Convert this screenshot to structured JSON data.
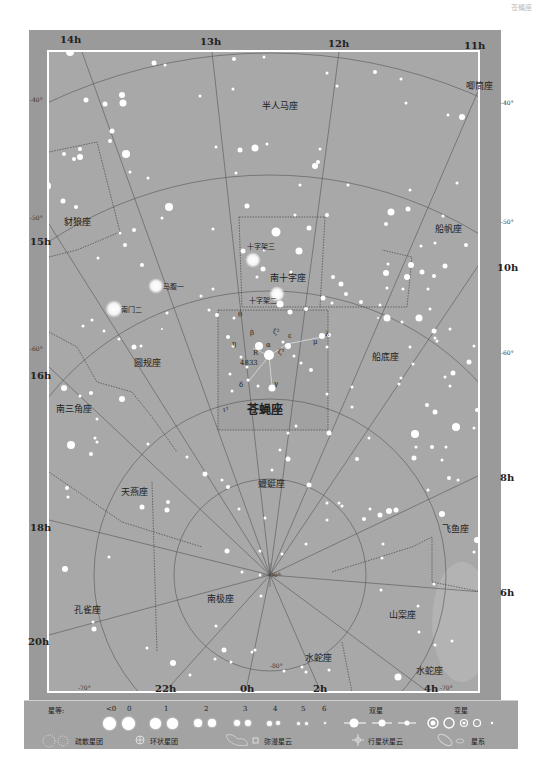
{
  "header": {
    "note": "苍蝇座"
  },
  "ra_top": [
    {
      "label": "14h",
      "x": 60,
      "y": 34
    },
    {
      "label": "13h",
      "x": 200,
      "y": 36
    },
    {
      "label": "12h",
      "x": 328,
      "y": 38
    },
    {
      "label": "11h",
      "x": 464,
      "y": 40
    }
  ],
  "ra_right": [
    {
      "label": "10h",
      "x": 495,
      "y": 265
    },
    {
      "label": "8h",
      "x": 498,
      "y": 476
    },
    {
      "label": "6h",
      "x": 498,
      "y": 591
    }
  ],
  "ra_left": [
    {
      "label": "15h",
      "x": 28,
      "y": 234
    },
    {
      "label": "16h",
      "x": 28,
      "y": 368
    },
    {
      "label": "18h",
      "x": 28,
      "y": 520
    },
    {
      "label": "20h",
      "x": 27,
      "y": 636
    }
  ],
  "ra_bottom": [
    {
      "label": "22h",
      "x": 157,
      "y": 686
    },
    {
      "label": "0h",
      "x": 240,
      "y": 686
    },
    {
      "label": "2h",
      "x": 314,
      "y": 686
    },
    {
      "label": "4h",
      "x": 424,
      "y": 686
    }
  ],
  "dec_labels": [
    {
      "label": "-40°",
      "x": 30,
      "y": 99
    },
    {
      "label": "-50°",
      "x": 30,
      "y": 215
    },
    {
      "label": "-60°",
      "x": 30,
      "y": 346
    },
    {
      "label": "-40°",
      "x": 500,
      "y": 101
    },
    {
      "label": "-50°",
      "x": 500,
      "y": 220
    },
    {
      "label": "-60°",
      "x": 500,
      "y": 352
    },
    {
      "label": "-70°",
      "x": 78,
      "y": 685
    },
    {
      "label": "-70°",
      "x": 440,
      "y": 685
    },
    {
      "label": "-80°",
      "x": 270,
      "y": 663
    },
    {
      "label": "-90°",
      "x": 268,
      "y": 573
    }
  ],
  "constellations": [
    {
      "name": "半人马座",
      "x": 268,
      "y": 104,
      "big": false
    },
    {
      "name": "唧筒座",
      "x": 466,
      "y": 84,
      "big": false
    },
    {
      "name": "豺狼座",
      "x": 65,
      "y": 220,
      "big": false
    },
    {
      "name": "船帆座",
      "x": 435,
      "y": 227,
      "big": false
    },
    {
      "name": "南十字座",
      "x": 272,
      "y": 277,
      "big": false
    },
    {
      "name": "圆规座",
      "x": 136,
      "y": 362,
      "big": false
    },
    {
      "name": "船底座",
      "x": 374,
      "y": 355,
      "big": false
    },
    {
      "name": "南三角座",
      "x": 58,
      "y": 407,
      "big": false
    },
    {
      "name": "苍蝇座",
      "x": 250,
      "y": 408,
      "big": true
    },
    {
      "name": "天燕座",
      "x": 120,
      "y": 490,
      "big": false
    },
    {
      "name": "蝘蜓座",
      "x": 262,
      "y": 482,
      "big": false
    },
    {
      "name": "飞鱼座",
      "x": 444,
      "y": 527,
      "big": false
    },
    {
      "name": "孔雀座",
      "x": 72,
      "y": 608,
      "big": false
    },
    {
      "name": "南极座",
      "x": 207,
      "y": 597,
      "big": false
    },
    {
      "name": "山案座",
      "x": 404,
      "y": 613,
      "big": false
    },
    {
      "name": "水蛇座",
      "x": 300,
      "y": 656,
      "big": false
    },
    {
      "name": "水蛇座",
      "x": 423,
      "y": 668,
      "big": false
    }
  ],
  "star_names": [
    {
      "name": "十字架三",
      "x": 247,
      "y": 245
    },
    {
      "name": "十字架二",
      "x": 249,
      "y": 298
    },
    {
      "name": "马腹一",
      "x": 166,
      "y": 285
    },
    {
      "name": "南门二",
      "x": 121,
      "y": 308
    },
    {
      "name": "θ",
      "x": 238,
      "y": 315
    },
    {
      "name": "β",
      "x": 251,
      "y": 334
    },
    {
      "name": "ζ²",
      "x": 274,
      "y": 332
    },
    {
      "name": "ε",
      "x": 289,
      "y": 335
    },
    {
      "name": "λ",
      "x": 325,
      "y": 333
    },
    {
      "name": "η",
      "x": 233,
      "y": 344
    },
    {
      "name": "α",
      "x": 267,
      "y": 345
    },
    {
      "name": "μ",
      "x": 314,
      "y": 341
    },
    {
      "name": "ζ¹",
      "x": 279,
      "y": 352
    },
    {
      "name": "R",
      "x": 254,
      "y": 352
    },
    {
      "name": "4833",
      "x": 241,
      "y": 362
    },
    {
      "name": "δ",
      "x": 240,
      "y": 385
    },
    {
      "name": "γ",
      "x": 275,
      "y": 383
    },
    {
      "name": "ι¹",
      "x": 224,
      "y": 410
    }
  ],
  "legend": {
    "magnitude_title": "星等:",
    "magnitudes": [
      "<0",
      "0",
      "1",
      "2",
      "3",
      "4",
      "5",
      "6"
    ],
    "double_star": "双星",
    "variable_star": "变星",
    "open_cluster": "疏散星团",
    "globular_cluster": "环状星团",
    "diffuse_nebula": "弥漫星云",
    "planetary_nebula": "行星状星云",
    "galaxy": "星系"
  },
  "colors": {
    "frame": "#9a9a9a",
    "chart_bg": "#a8a8a8",
    "border": "#ffffff",
    "lines": "#555555",
    "text": "#222222"
  }
}
